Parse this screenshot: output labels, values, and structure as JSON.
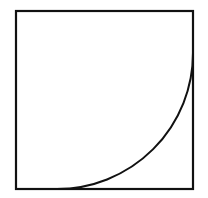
{
  "figure": {
    "type": "geometric-diagram",
    "title": "Square with inscribed quarter arc",
    "background_color": "#ffffff",
    "stroke_color": "#111111",
    "canvas": {
      "width": 208,
      "height": 198
    },
    "square": {
      "name": "outer-square",
      "left": 16,
      "top": 11,
      "right": 193,
      "bottom": 189,
      "width": 177,
      "height": 178,
      "stroke_width": 2.2,
      "fill": "none"
    },
    "arc": {
      "name": "quarter-circle-arc",
      "center_x": 193,
      "center_y": 189,
      "radius": 136,
      "start_x": 57,
      "start_y": 189,
      "end_x": 193,
      "end_y": 53,
      "sweep_degrees": 90,
      "stroke_width": 2.0,
      "fill": "none",
      "start_tangent": "vertical",
      "end_tangent": "horizontal"
    },
    "labels": [],
    "annotations": []
  }
}
